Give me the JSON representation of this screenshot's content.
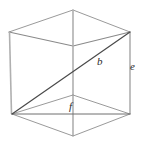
{
  "figure": {
    "type": "geometric-diagram",
    "shape": "rectangular-box",
    "background_color": "#ffffff",
    "line_colors": {
      "visible_edge": "#8a8a8a",
      "hidden_edge": "#9a9a9a",
      "vertical_edge": "#b0b0b0",
      "space_diagonal": "#4a4a4a",
      "base_diagonal": "#6e6e6e"
    },
    "labels": {
      "space_diagonal": "b",
      "vertical_edge": "e",
      "base_diagonal": "f"
    },
    "vertices": {
      "front_top_left": [
        9,
        32
      ],
      "front_top_right": [
        130,
        32
      ],
      "front_bottom_left": [
        12,
        114
      ],
      "front_bottom_right": [
        130,
        114
      ],
      "back_top_center": [
        73,
        10
      ],
      "near_top_center": [
        73,
        46
      ],
      "near_bottom_center": [
        73,
        136
      ]
    },
    "segments": [
      {
        "name": "top-back-left",
        "from": [
          9,
          32
        ],
        "to": [
          73,
          10
        ],
        "style": "edge-light"
      },
      {
        "name": "top-back-right",
        "from": [
          73,
          10
        ],
        "to": [
          130,
          32
        ],
        "style": "edge-light"
      },
      {
        "name": "top-front-left",
        "from": [
          9,
          32
        ],
        "to": [
          73,
          46
        ],
        "style": "edge-mid"
      },
      {
        "name": "top-front-right",
        "from": [
          73,
          46
        ],
        "to": [
          130,
          32
        ],
        "style": "edge-mid"
      },
      {
        "name": "left-vertical",
        "from": [
          9,
          32
        ],
        "to": [
          12,
          114
        ],
        "style": "edge-vert"
      },
      {
        "name": "right-vertical",
        "from": [
          130,
          32
        ],
        "to": [
          130,
          114
        ],
        "style": "edge-vert"
      },
      {
        "name": "center-vertical",
        "from": [
          73,
          10
        ],
        "to": [
          73,
          136
        ],
        "style": "edge-vert"
      },
      {
        "name": "bottom-back-left",
        "from": [
          12,
          114
        ],
        "to": [
          73,
          95
        ],
        "style": "edge-light"
      },
      {
        "name": "bottom-back-right",
        "from": [
          73,
          95
        ],
        "to": [
          130,
          114
        ],
        "style": "edge-light"
      },
      {
        "name": "bottom-front-left",
        "from": [
          12,
          114
        ],
        "to": [
          73,
          136
        ],
        "style": "edge-light"
      },
      {
        "name": "bottom-front-right",
        "from": [
          73,
          136
        ],
        "to": [
          130,
          114
        ],
        "style": "edge-light"
      },
      {
        "name": "bottom-edge-horizontal",
        "from": [
          12,
          114
        ],
        "to": [
          130,
          114
        ],
        "style": "diag-base"
      },
      {
        "name": "space-diagonal-b",
        "from": [
          12,
          114
        ],
        "to": [
          130,
          32
        ],
        "style": "diag-main"
      }
    ]
  }
}
